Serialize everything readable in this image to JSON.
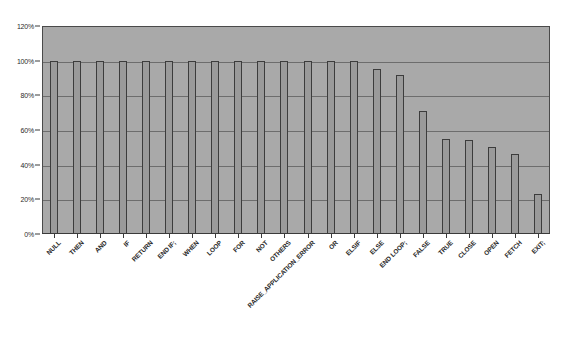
{
  "chart_data": {
    "type": "bar",
    "title": "",
    "subtitle": "",
    "xlabel": "",
    "ylabel": "",
    "ylim": [
      0,
      120
    ],
    "yticks": [
      "0%",
      "20%",
      "40%",
      "60%",
      "80%",
      "100%",
      "120%"
    ],
    "ytick_values": [
      0,
      20,
      40,
      60,
      80,
      100,
      120
    ],
    "grid": true,
    "legend": false,
    "legend_position": "none",
    "value_suffix": "%",
    "categories": [
      "NULL",
      "THEN",
      "AND",
      "IF",
      "RETURN",
      "END IF;",
      "WHEN",
      "LOOP",
      "FOR",
      "NOT",
      "OTHERS",
      "RAISE_APPLICATION_ERROR",
      "OR",
      "ELSIF",
      "ELSE",
      "END LOOP;",
      "FALSE",
      "TRUE",
      "CLOSE",
      "OPEN",
      "FETCH",
      "EXIT;"
    ],
    "values": [
      100,
      100,
      100,
      100,
      100,
      100,
      100,
      100,
      100,
      100,
      100,
      100,
      100,
      100,
      95,
      92,
      71,
      55,
      54,
      50,
      46,
      23
    ]
  },
  "colors": {
    "plot_background": "#a9a9a9",
    "page_background": "#ffffff",
    "bar_fill": "#9a9a9a",
    "bar_border": "#3c3c3c",
    "gridline": "#6d6d6d",
    "axis": "#3a3a3a",
    "text": "#2a2a2a"
  }
}
